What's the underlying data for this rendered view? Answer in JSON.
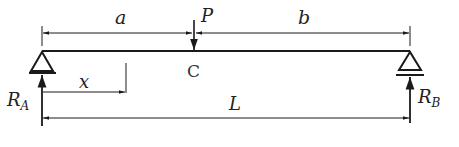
{
  "diagram": {
    "type": "simply-supported-beam-point-load",
    "colors": {
      "stroke": "#1a1a1a",
      "text": "#222222",
      "background": "#ffffff"
    },
    "labels": {
      "a": "a",
      "b": "b",
      "P": "P",
      "C": "C",
      "x": "x",
      "L": "L",
      "RA_main": "R",
      "RA_sub": "A",
      "RB_main": "R",
      "RB_sub": "B"
    },
    "elements": {
      "beam": "horizontal beam from support A to support B",
      "load": "point load P acting downward at point C",
      "support_left": "pin support A (triangle)",
      "support_right": "roller support B (triangle with base line)",
      "dimensions": [
        "a: A to C",
        "b: C to B",
        "x: from A to section",
        "L: A to B (span)"
      ]
    }
  }
}
